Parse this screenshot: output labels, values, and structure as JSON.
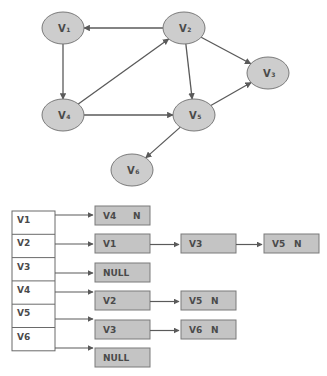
{
  "graph": {
    "title": "Directed graph",
    "colors": {
      "node_fill": "#cdcdcd",
      "node_stroke": "#7a7a7a",
      "edge": "#5a5a5a",
      "text": "#4a4a4a"
    },
    "nodes": [
      {
        "id": "V1",
        "label": "V",
        "sub": "1",
        "cx": 63,
        "cy": 28
      },
      {
        "id": "V2",
        "label": "V",
        "sub": "2",
        "cx": 184,
        "cy": 28
      },
      {
        "id": "V3",
        "label": "V",
        "sub": "3",
        "cx": 268,
        "cy": 73
      },
      {
        "id": "V4",
        "label": "V",
        "sub": "4",
        "cx": 63,
        "cy": 115
      },
      {
        "id": "V5",
        "label": "V",
        "sub": "5",
        "cx": 194,
        "cy": 115
      },
      {
        "id": "V6",
        "label": "V",
        "sub": "6",
        "cx": 132,
        "cy": 170
      }
    ],
    "edges": [
      {
        "from": "V2",
        "to": "V1"
      },
      {
        "from": "V1",
        "to": "V4"
      },
      {
        "from": "V4",
        "to": "V2"
      },
      {
        "from": "V2",
        "to": "V5"
      },
      {
        "from": "V2",
        "to": "V3"
      },
      {
        "from": "V4",
        "to": "V5"
      },
      {
        "from": "V5",
        "to": "V3"
      },
      {
        "from": "V5",
        "to": "V6"
      }
    ]
  },
  "adjacency_list": {
    "colors": {
      "node_fill": "#c4c4c4",
      "node_stroke": "#7a7a7a",
      "index_fill": "#ffffff",
      "index_stroke": "#6a6a6a"
    },
    "rows": [
      {
        "vertex": "V1",
        "list": [
          {
            "label": "V4",
            "null_ptr": "N"
          }
        ]
      },
      {
        "vertex": "V2",
        "list": [
          {
            "label": "V1"
          },
          {
            "label": "V3"
          },
          {
            "label": "V5",
            "null_ptr": "N"
          }
        ]
      },
      {
        "vertex": "V3",
        "list": [
          {
            "label": "NULL"
          }
        ]
      },
      {
        "vertex": "V4",
        "list": [
          {
            "label": "V2"
          },
          {
            "label": "V5",
            "null_ptr": "N"
          }
        ]
      },
      {
        "vertex": "V5",
        "list": [
          {
            "label": "V3"
          },
          {
            "label": "V6",
            "null_ptr": "N"
          }
        ]
      },
      {
        "vertex": "V6",
        "list": [
          {
            "label": "NULL"
          }
        ]
      }
    ]
  }
}
